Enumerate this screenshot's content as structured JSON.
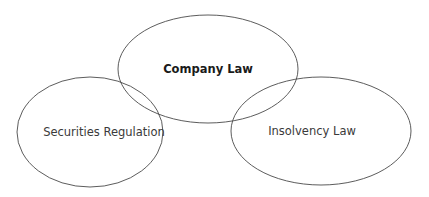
{
  "diagram": {
    "type": "venn",
    "sets": [
      {
        "id": "company",
        "label": "Company Law",
        "bold": true,
        "cx": 208,
        "cy": 69,
        "rx": 90,
        "ry": 54
      },
      {
        "id": "securities",
        "label": "Securities Regulation",
        "bold": false,
        "cx": 90,
        "cy": 132,
        "rx": 73,
        "ry": 55
      },
      {
        "id": "insolvency",
        "label": "Insolvency Law",
        "bold": false,
        "cx": 321,
        "cy": 131,
        "rx": 90,
        "ry": 54
      }
    ],
    "colors": {
      "stroke": "#4a4a4a",
      "background": "#ffffff",
      "text": "#3a3a3a"
    }
  }
}
